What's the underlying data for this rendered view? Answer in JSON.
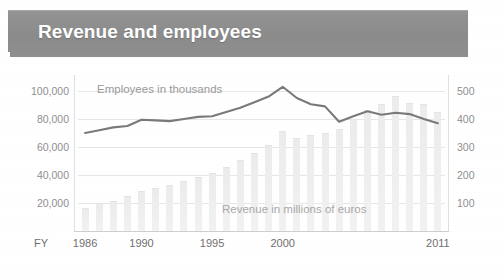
{
  "header": {
    "title": "Revenue and employees",
    "bar_color": "#8e8e8e",
    "title_color": "#ffffff"
  },
  "annotations": {
    "employees_label": "Employees in thousands",
    "revenue_label": "Revenue in millions of euros",
    "fy_label": "FY"
  },
  "axes": {
    "left": {
      "name": "Employees in thousands",
      "ticks": [
        "20,000",
        "40,000",
        "60,000",
        "80,000",
        "100,000"
      ],
      "tick_values": [
        20000,
        40000,
        60000,
        80000,
        100000
      ],
      "range": [
        0,
        110000
      ]
    },
    "right": {
      "name": "Revenue in millions of euros",
      "ticks": [
        "100",
        "200",
        "300",
        "400",
        "500"
      ],
      "tick_values": [
        100,
        200,
        300,
        400,
        500
      ],
      "range": [
        0,
        550
      ]
    },
    "x": {
      "label": "FY",
      "visible_ticks": [
        "1986",
        "1990",
        "1995",
        "2000",
        "2011"
      ],
      "range": [
        1986,
        2011
      ]
    }
  },
  "chart_data": {
    "type": "line",
    "title": "Revenue and employees",
    "xlabel": "FY",
    "ylabel": "Employees in thousands",
    "y2label": "Revenue in millions of euros",
    "grid": true,
    "legend": "in-plot annotations",
    "ylim": [
      0,
      110000
    ],
    "y2lim": [
      0,
      550
    ],
    "x": [
      1986,
      1987,
      1988,
      1989,
      1990,
      1991,
      1992,
      1993,
      1994,
      1995,
      1996,
      1997,
      1998,
      1999,
      2000,
      2001,
      2002,
      2003,
      2004,
      2005,
      2006,
      2007,
      2008,
      2009,
      2010,
      2011
    ],
    "categories": [
      "1986",
      "1987",
      "1988",
      "1989",
      "1990",
      "1991",
      "1992",
      "1993",
      "1994",
      "1995",
      "1996",
      "1997",
      "1998",
      "1999",
      "2000",
      "2001",
      "2002",
      "2003",
      "2004",
      "2005",
      "2006",
      "2007",
      "2008",
      "2009",
      "2010",
      "2011"
    ],
    "series": [
      {
        "name": "Employees in thousands",
        "type": "line",
        "axis": "left",
        "unit": "employees",
        "color": "#7a7a7a",
        "values": [
          70000,
          72000,
          74000,
          75000,
          79500,
          79000,
          78500,
          80000,
          81500,
          82000,
          85000,
          88000,
          92000,
          96000,
          103000,
          95000,
          90500,
          89000,
          78000,
          82000,
          85500,
          83000,
          84500,
          83500,
          80000,
          77000
        ]
      },
      {
        "name": "Revenue in millions of euros",
        "type": "bar",
        "axis": "right",
        "unit": "million EUR",
        "color": "#eeeeee",
        "values": [
          80,
          95,
          105,
          120,
          140,
          150,
          160,
          175,
          190,
          205,
          225,
          250,
          275,
          305,
          355,
          330,
          340,
          345,
          360,
          395,
          430,
          450,
          480,
          455,
          450,
          420
        ]
      }
    ]
  }
}
